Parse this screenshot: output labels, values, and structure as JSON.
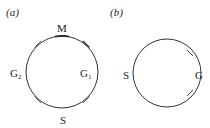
{
  "panels": [
    {
      "id": "a",
      "label": "(a)",
      "circle": {
        "cx": 62,
        "cy": 72,
        "r": 36
      },
      "phases": [
        {
          "name": "M",
          "position": "top"
        },
        {
          "name": "G1",
          "base": "G",
          "subscript": "1",
          "position": "right"
        },
        {
          "name": "S",
          "position": "bottom"
        },
        {
          "name": "G2",
          "base": "G",
          "subscript": "2",
          "position": "left"
        }
      ],
      "tick_angles_deg": [
        -135,
        -45,
        45,
        135
      ]
    },
    {
      "id": "b",
      "label": "(b)",
      "circle": {
        "cx": 167,
        "cy": 73,
        "r": 34
      },
      "phases": [
        {
          "name": "S",
          "position": "left"
        },
        {
          "name": "G",
          "position": "right"
        }
      ],
      "tick_angles_deg": [
        -45,
        45
      ]
    }
  ],
  "colors": {
    "stroke": "#333333",
    "text": "#222222",
    "background": "#ffffff"
  }
}
